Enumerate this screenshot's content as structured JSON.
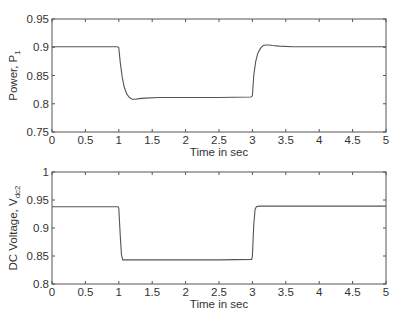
{
  "chart_data": [
    {
      "type": "line",
      "title": "",
      "xlabel": "Time in sec",
      "ylabel": "Power, P",
      "ylabel_subscript": "1",
      "xlim": [
        0,
        5
      ],
      "ylim": [
        0.75,
        0.95
      ],
      "xticks": [
        "0",
        "0.5",
        "1",
        "1.5",
        "2",
        "2.5",
        "3",
        "3.5",
        "4",
        "4.5",
        "5"
      ],
      "yticks": [
        "0.75",
        "0.8",
        "0.85",
        "0.9",
        "0.95"
      ],
      "grid": false,
      "legend": null,
      "series": [
        {
          "name": "P1",
          "x": [
            0,
            0.5,
            0.98,
            1.0,
            1.02,
            1.05,
            1.08,
            1.12,
            1.16,
            1.2,
            1.25,
            1.3,
            1.4,
            1.6,
            2.0,
            2.5,
            2.98,
            3.0,
            3.02,
            3.05,
            3.08,
            3.12,
            3.16,
            3.2,
            3.25,
            3.3,
            3.4,
            3.6,
            4.0,
            4.5,
            5.0
          ],
          "y": [
            0.901,
            0.901,
            0.901,
            0.899,
            0.875,
            0.848,
            0.83,
            0.817,
            0.811,
            0.808,
            0.808,
            0.809,
            0.81,
            0.811,
            0.811,
            0.811,
            0.812,
            0.814,
            0.85,
            0.875,
            0.889,
            0.898,
            0.903,
            0.904,
            0.904,
            0.903,
            0.902,
            0.901,
            0.901,
            0.901,
            0.901
          ]
        }
      ]
    },
    {
      "type": "line",
      "title": "",
      "xlabel": "Time in sec",
      "ylabel": "DC Voltage, V",
      "ylabel_subscript": "dc2",
      "xlim": [
        0,
        5
      ],
      "ylim": [
        0.8,
        1.0
      ],
      "xticks": [
        "0",
        "0.5",
        "1",
        "1.5",
        "2",
        "2.5",
        "3",
        "3.5",
        "4",
        "4.5",
        "5"
      ],
      "yticks": [
        "0.8",
        "0.85",
        "0.9",
        "0.95",
        "1"
      ],
      "grid": false,
      "legend": null,
      "series": [
        {
          "name": "Vdc2",
          "x": [
            0,
            0.5,
            0.99,
            1.0,
            1.02,
            1.04,
            1.06,
            1.1,
            1.5,
            2.0,
            2.5,
            2.99,
            3.0,
            3.02,
            3.04,
            3.06,
            3.1,
            3.5,
            4.0,
            4.5,
            5.0
          ],
          "y": [
            0.938,
            0.938,
            0.938,
            0.935,
            0.89,
            0.852,
            0.843,
            0.843,
            0.843,
            0.843,
            0.843,
            0.844,
            0.85,
            0.905,
            0.933,
            0.938,
            0.939,
            0.939,
            0.939,
            0.939,
            0.939
          ]
        }
      ]
    }
  ],
  "colors": {
    "line": "#555555",
    "axes": "#555555",
    "text": "#333333",
    "background": "#ffffff"
  }
}
